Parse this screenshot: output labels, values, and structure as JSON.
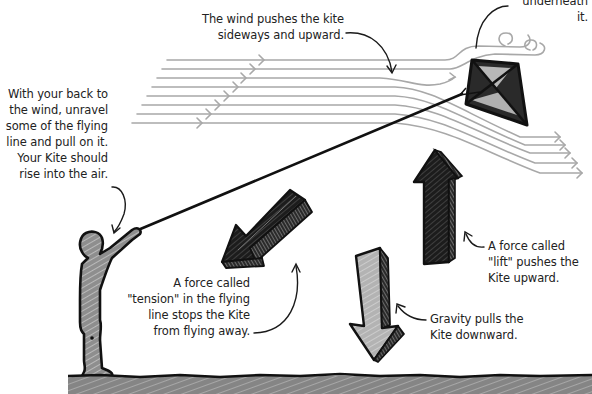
{
  "diagram": {
    "colors": {
      "ink": "#1a1a1a",
      "wind_lines": "#a8a8a8",
      "fill_gray": "#9a9a9a",
      "fill_light": "#bdbdbd",
      "background": "#ffffff"
    },
    "labels": {
      "underneath": "underneath it.",
      "wind": "The wind pushes the kite\nsideways and upward.",
      "instructions": "With your back to\nthe wind, unravel\nsome of the flying\nline and pull on it.\nYour Kite should\nrise into the air.",
      "tension": "A force called\n\"tension\" in the flying\nline stops the Kite\nfrom flying away.",
      "lift": "A force called\n\"lift\" pushes the\nKite upward.",
      "gravity": "Gravity pulls the\nKite downward."
    },
    "elements": {
      "kite": "kite",
      "person": "person-holding-line",
      "flying_line": "flying-line",
      "wind_lines_count": 8,
      "arrows": [
        "tension-arrow",
        "lift-arrow",
        "gravity-arrow"
      ],
      "ground": "ground"
    }
  }
}
